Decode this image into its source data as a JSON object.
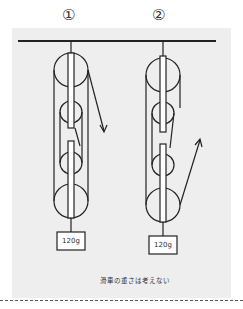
{
  "figure": {
    "labels": [
      "①",
      "②"
    ],
    "caption": "滑車の重さは考えない",
    "systems": [
      {
        "id": "1",
        "weight_label": "120g",
        "pull_direction": "down-right"
      },
      {
        "id": "2",
        "weight_label": "120g",
        "pull_direction": "up-right"
      }
    ],
    "colors": {
      "background": "#eeeeee",
      "line": "#222222"
    }
  }
}
